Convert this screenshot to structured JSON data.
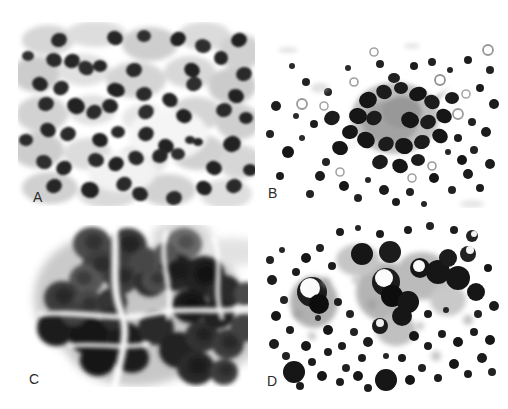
{
  "figure": {
    "kind": "micrograph-figure-grid",
    "width": 508,
    "height": 409,
    "background_color": "#ffffff",
    "panel_count": 4,
    "labels": {
      "a": "A",
      "b": "B",
      "c": "C",
      "d": "D"
    }
  },
  "panels": [
    {
      "id": "a",
      "label": "A",
      "position": "top-left",
      "x": 18,
      "y": 22,
      "width": 237,
      "height": 184,
      "description": "Dense sheet of uniform dark round-to-oval nuclei on pale gray cytoplasm background",
      "palette": {
        "background": "#ffffff",
        "cytoplasm": "#c9c9c9",
        "cytoplasm_light": "#dedede",
        "nucleus": "#2e2e2e",
        "nucleus_dark": "#1a1a1a"
      },
      "cell_count": 62,
      "nucleus_size_px": [
        11,
        17
      ]
    },
    {
      "id": "b",
      "label": "B",
      "position": "top-right",
      "x": 262,
      "y": 26,
      "width": 240,
      "height": 182,
      "description": "Central three-dimensional cell cluster with radiating processes surrounded by scattered small dark cells and clear vacuoles on white background",
      "palette": {
        "background": "#ffffff",
        "cluster_core": "#5c5c5c",
        "nucleus": "#1e1e1e",
        "vacuole_ring": "#8a8a8a"
      },
      "cluster_center": [
        395,
        118
      ],
      "cluster_radius_px": 52,
      "scattered_cell_count": 58,
      "ring_vacuole_count": 11
    },
    {
      "id": "c",
      "label": "C",
      "position": "bottom-left",
      "x": 18,
      "y": 218,
      "width": 237,
      "height": 176,
      "description": "Large cohesive three-dimensional cluster of overlapping hyperchromatic cells with molded nuclei, high magnification",
      "palette": {
        "background": "#ffffff",
        "cell_mid": "#4a4a4a",
        "cell_dark": "#141414",
        "halo": "#b4b4b4"
      },
      "cell_count": 34,
      "cell_size_px": [
        26,
        46
      ]
    },
    {
      "id": "d",
      "label": "D",
      "position": "bottom-right",
      "x": 262,
      "y": 210,
      "width": 240,
      "height": 186,
      "description": "Dispersed small dark cells with a few larger cells showing prominent clear nucleoli and pale cytoplasm, on clean white background",
      "palette": {
        "background": "#ffffff",
        "nucleus": "#1a1a1a",
        "cytoplasm": "#9e9e9e",
        "nucleolus": "#ffffff"
      },
      "scattered_cell_count": 96,
      "large_cell_count": 9
    }
  ]
}
